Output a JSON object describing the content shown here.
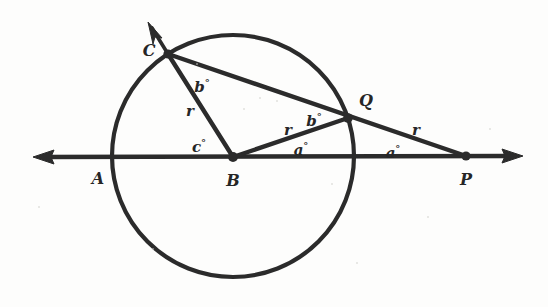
{
  "figure": {
    "background_color": "#fdfdfc",
    "ink_color": "#2b2b2b",
    "circle": {
      "center_label": "B",
      "cx": 233,
      "cy": 156,
      "r": 121
    },
    "points": [
      {
        "name": "A",
        "label": "A",
        "x": 112,
        "y": 157,
        "label_x": 98,
        "label_y": 178,
        "dot": false
      },
      {
        "name": "B",
        "label": "B",
        "x": 233,
        "y": 157,
        "label_x": 233,
        "label_y": 180,
        "dot": true
      },
      {
        "name": "C",
        "label": "C",
        "x": 168,
        "y": 54,
        "label_x": 149,
        "label_y": 50,
        "dot": true
      },
      {
        "name": "Q",
        "label": "Q",
        "x": 348,
        "y": 118,
        "label_x": 366,
        "label_y": 100,
        "dot": true
      },
      {
        "name": "P",
        "label": "P",
        "x": 466,
        "y": 156,
        "label_x": 466,
        "label_y": 179,
        "dot": true
      }
    ],
    "measures": [
      {
        "name": "angle-bcq",
        "text": "b",
        "degree": "°",
        "x": 202,
        "y": 86
      },
      {
        "name": "radius-bc",
        "text": "r",
        "degree": "",
        "x": 190,
        "y": 110
      },
      {
        "name": "angle-cba",
        "text": "c",
        "degree": "°",
        "x": 199,
        "y": 146
      },
      {
        "name": "radius-bq",
        "text": "r",
        "degree": "",
        "x": 288,
        "y": 129
      },
      {
        "name": "angle-bqc",
        "text": "b",
        "degree": "°",
        "x": 314,
        "y": 120
      },
      {
        "name": "angle-qbp",
        "text": "a",
        "degree": "°",
        "x": 301,
        "y": 149
      },
      {
        "name": "radius-qp",
        "text": "r",
        "degree": "",
        "x": 416,
        "y": 129
      },
      {
        "name": "angle-qpb",
        "text": "a",
        "degree": "°",
        "x": 393,
        "y": 152
      }
    ],
    "segments": [
      {
        "name": "line-apb-horizontal",
        "from": "left-arrow",
        "to": "right-arrow"
      },
      {
        "name": "segment-bc-radius",
        "from": "B",
        "to": "C"
      },
      {
        "name": "ray-cq-to-p",
        "from": "C",
        "to": "P"
      },
      {
        "name": "segment-bq-radius",
        "from": "B",
        "to": "Q"
      },
      {
        "name": "ray-through-c-arrow",
        "from": "C",
        "to": "arrow-up-left"
      }
    ],
    "arrows": [
      {
        "name": "arrow-left-horizontal",
        "tip_x": 33,
        "tip_y": 157,
        "direction": "left"
      },
      {
        "name": "arrow-right-horizontal",
        "tip_x": 523,
        "tip_y": 156,
        "direction": "right"
      },
      {
        "name": "arrow-upper-left-ray",
        "tip_x": 148,
        "tip_y": 22,
        "direction": "up-left"
      }
    ]
  }
}
